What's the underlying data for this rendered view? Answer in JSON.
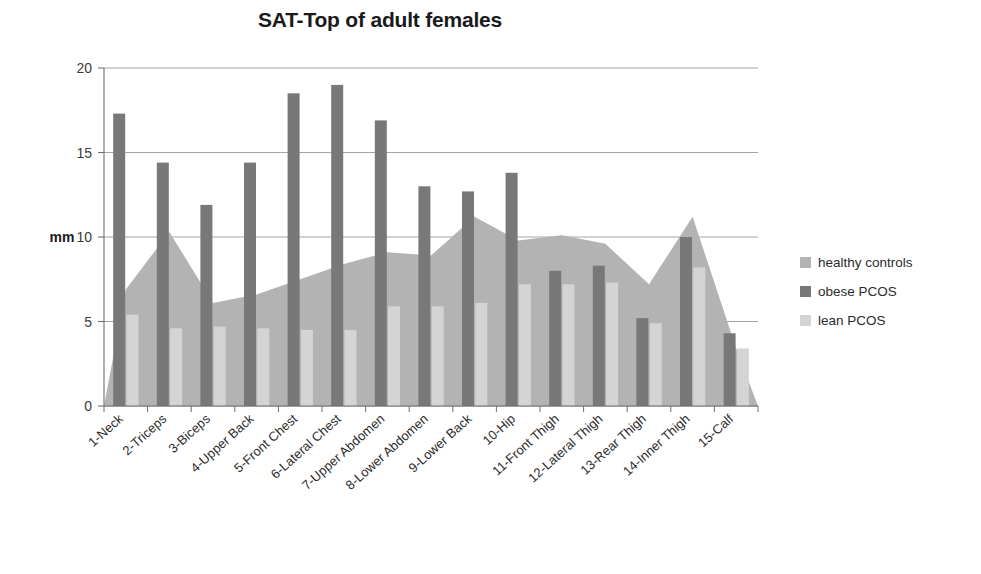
{
  "chart_data": {
    "type": "bar",
    "title": "SAT-Top of adult females",
    "xlabel": "",
    "ylabel": "mm",
    "ylim": [
      0,
      20
    ],
    "yticks": [
      0,
      5,
      10,
      15,
      20
    ],
    "grid": true,
    "legend_position": "right",
    "categories": [
      "1-Neck",
      "2-Triceps",
      "3-Biceps",
      "4-Upper Back",
      "5-Front Chest",
      "6-Lateral Chest",
      "7-Upper Abdomen",
      "8-Lower Abdomen",
      "9-Lower Back",
      "10-Hip",
      "11-Front Thigh",
      "12-Lateral Thigh",
      "13-Rear Thigh",
      "14-Inner Thigh",
      "15-Calf"
    ],
    "series": [
      {
        "name": "healthy controls",
        "render": "area",
        "color": "#b3b3b3",
        "values": [
          6.9,
          10.3,
          6.1,
          6.6,
          7.5,
          8.4,
          9.1,
          8.9,
          11.2,
          9.8,
          10.1,
          9.6,
          7.2,
          11.2,
          3.4
        ]
      },
      {
        "name": "obese PCOS",
        "render": "bar",
        "color": "#787878",
        "values": [
          17.3,
          14.4,
          11.9,
          14.4,
          18.5,
          19.0,
          16.9,
          13.0,
          12.7,
          13.8,
          8.0,
          8.3,
          5.2,
          10.0,
          4.3
        ]
      },
      {
        "name": "lean PCOS",
        "render": "bar",
        "color": "#d4d4d4",
        "values": [
          5.4,
          4.6,
          4.7,
          4.6,
          4.5,
          4.5,
          5.9,
          5.9,
          6.1,
          7.2,
          7.2,
          7.3,
          4.9,
          8.2,
          3.4
        ]
      }
    ]
  },
  "legend": {
    "items": [
      {
        "label": "healthy controls",
        "color": "#b3b3b3"
      },
      {
        "label": "obese PCOS",
        "color": "#787878"
      },
      {
        "label": "lean PCOS",
        "color": "#d4d4d4"
      }
    ]
  }
}
